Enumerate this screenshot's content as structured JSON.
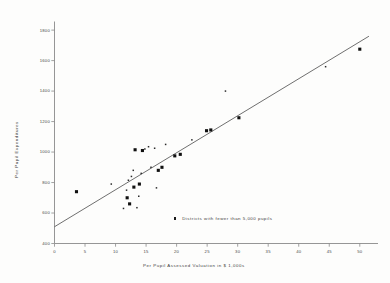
{
  "chart_data": {
    "type": "scatter",
    "title": "",
    "xlabel": "Per Pupil  Assessed Valuation in $ 1,000s",
    "ylabel": "Per Pupil Expenditures",
    "xlim": [
      0,
      52
    ],
    "ylim": [
      400,
      1850
    ],
    "grid": false,
    "xticks": [
      "0",
      "5",
      "10",
      "15",
      "20",
      "25",
      "30",
      "35",
      "40",
      "45",
      "50"
    ],
    "xtick_values": [
      0,
      5,
      10,
      15,
      20,
      25,
      30,
      35,
      40,
      45,
      50
    ],
    "yticks": [
      "400",
      "600",
      "800",
      "1000",
      "1200",
      "1400",
      "1600",
      "1800"
    ],
    "ytick_values": [
      400,
      600,
      800,
      1000,
      1200,
      1400,
      1600,
      1800
    ],
    "legend": {
      "position": "inside-lower-center",
      "entries": [
        {
          "label": "Districts with  fewer than 5,000 pupils",
          "marker": "small-square",
          "color": "#1a1a1a"
        }
      ]
    },
    "series": [
      {
        "name": "Districts with 5,000 or more pupils",
        "marker": "large-square",
        "color": "#101010",
        "points": [
          {
            "x": 3.6,
            "y": 740
          },
          {
            "x": 11.9,
            "y": 700
          },
          {
            "x": 12.3,
            "y": 660
          },
          {
            "x": 13.0,
            "y": 770
          },
          {
            "x": 13.2,
            "y": 1015
          },
          {
            "x": 13.9,
            "y": 790
          },
          {
            "x": 14.4,
            "y": 1010
          },
          {
            "x": 17.0,
            "y": 880
          },
          {
            "x": 17.6,
            "y": 900
          },
          {
            "x": 19.7,
            "y": 975
          },
          {
            "x": 20.6,
            "y": 985
          },
          {
            "x": 24.9,
            "y": 1140
          },
          {
            "x": 25.6,
            "y": 1145
          },
          {
            "x": 30.2,
            "y": 1225
          },
          {
            "x": 50.0,
            "y": 1675
          }
        ]
      },
      {
        "name": "Districts with fewer than 5,000 pupils",
        "marker": "small-square",
        "color": "#2a2a2a",
        "points": [
          {
            "x": 9.3,
            "y": 790
          },
          {
            "x": 11.3,
            "y": 630
          },
          {
            "x": 11.8,
            "y": 750
          },
          {
            "x": 12.1,
            "y": 815
          },
          {
            "x": 12.6,
            "y": 840
          },
          {
            "x": 12.9,
            "y": 880
          },
          {
            "x": 13.5,
            "y": 635
          },
          {
            "x": 13.8,
            "y": 710
          },
          {
            "x": 14.2,
            "y": 860
          },
          {
            "x": 14.8,
            "y": 1020
          },
          {
            "x": 15.4,
            "y": 1035
          },
          {
            "x": 15.8,
            "y": 900
          },
          {
            "x": 16.4,
            "y": 1025
          },
          {
            "x": 16.7,
            "y": 765
          },
          {
            "x": 18.2,
            "y": 1050
          },
          {
            "x": 22.5,
            "y": 1080
          },
          {
            "x": 28.0,
            "y": 1400
          },
          {
            "x": 44.4,
            "y": 1560
          }
        ]
      }
    ],
    "trendline": {
      "label": "regression line",
      "color": "#555555",
      "x_start": 0,
      "y_start": 510,
      "x_end": 51.5,
      "y_end": 1760
    }
  }
}
